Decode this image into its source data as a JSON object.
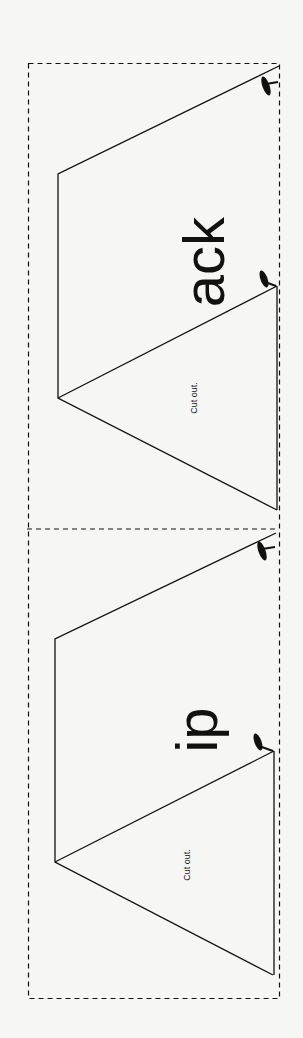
{
  "panels": [
    {
      "id": "top",
      "big_text": "ack",
      "cut_label": "Cut out."
    },
    {
      "id": "bottom",
      "big_text": "ip",
      "cut_label": "Cut out."
    }
  ],
  "colors": {
    "background": "#f6f6f4",
    "ink": "#111111"
  }
}
